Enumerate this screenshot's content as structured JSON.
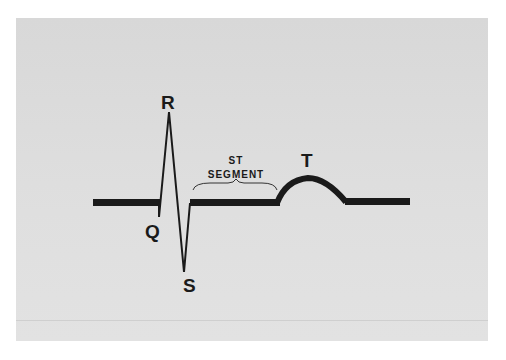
{
  "diagram": {
    "type": "ECG waveform",
    "labels": {
      "r": "R",
      "q": "Q",
      "s": "S",
      "t": "T",
      "st_line1": "ST",
      "st_line2": "SEGMENT"
    },
    "colors": {
      "background": "#ffffff",
      "panel": "#dcdcdc",
      "trace": "#1a1a1a"
    }
  }
}
